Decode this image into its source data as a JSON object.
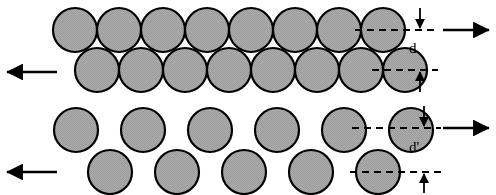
{
  "figure": {
    "width": 496,
    "height": 195,
    "background": "#ffffff"
  },
  "style": {
    "circle_fill": "#a8a8a8",
    "circle_stroke": "#000000",
    "circle_stroke_width": 2.2,
    "circle_radius": 22,
    "arrow_color": "#000000",
    "dash_color": "#000000",
    "text_color": "#000000"
  },
  "panels": [
    {
      "id": "dense-packing",
      "name": "Dense close-packed state",
      "spacing_label": "d",
      "rows": [
        {
          "id": "top-row-dense",
          "cy": 30,
          "cx": [
            75,
            119,
            163,
            207,
            251,
            295,
            339,
            383
          ],
          "count": 8
        },
        {
          "id": "bottom-row-dense",
          "cy": 70,
          "cx": [
            97,
            141,
            185,
            229,
            273,
            317,
            361,
            405
          ],
          "count": 8
        }
      ],
      "shear_arrows": [
        {
          "id": "top-shear-right",
          "direction": "right",
          "x1": 443,
          "x2": 491,
          "y": 30
        },
        {
          "id": "bottom-shear-left",
          "direction": "left",
          "x1": 57,
          "x2": 5,
          "y": 72
        }
      ],
      "dimension": {
        "id": "dimension-d",
        "x": 420,
        "y_top": 30,
        "y_bottom": 70,
        "label": "d",
        "label_x": 409,
        "label_y": 41,
        "leader_upper": {
          "y": 30,
          "x1": 355,
          "x2": 438
        },
        "leader_lower": {
          "y": 70,
          "x1": 372,
          "x2": 438
        }
      }
    },
    {
      "id": "dilated-packing",
      "name": "Dilated loosened state",
      "spacing_label": "d'",
      "rows": [
        {
          "id": "top-row-dilated",
          "cy": 130,
          "cx": [
            76,
            143,
            210,
            277,
            344,
            411
          ],
          "count": 6
        },
        {
          "id": "bottom-row-dilated",
          "cy": 172,
          "cx": [
            110,
            177,
            244,
            311,
            378
          ],
          "count": 5
        }
      ],
      "shear_arrows": [
        {
          "id": "top-shear-right",
          "direction": "right",
          "x1": 443,
          "x2": 491,
          "y": 128
        },
        {
          "id": "bottom-shear-left",
          "direction": "left",
          "x1": 57,
          "x2": 5,
          "y": 172
        }
      ],
      "dimension": {
        "id": "dimension-d-prime",
        "x": 424,
        "y_top": 128,
        "y_bottom": 172,
        "label": "d'",
        "label_x": 409,
        "label_y": 140,
        "leader_upper": {
          "y": 128,
          "x1": 352,
          "x2": 440
        },
        "leader_lower": {
          "y": 172,
          "x1": 350,
          "x2": 440
        }
      }
    }
  ],
  "annotations": {
    "d_label": "d",
    "d_prime_label": "d'"
  }
}
